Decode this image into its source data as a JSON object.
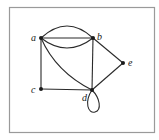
{
  "figure": {
    "type": "undirected multigraph with loop",
    "frame": {
      "x": 9,
      "y": 7,
      "width": 145,
      "height": 125,
      "stroke": "#9a9a9a"
    },
    "edge_color": "#2a2a2a",
    "node_color": "#1a1a1a"
  },
  "nodes": [
    {
      "id": "a",
      "label": "a",
      "x": 41,
      "y": 38,
      "label_x": 31,
      "label_y": 41
    },
    {
      "id": "b",
      "label": "b",
      "x": 93,
      "y": 38,
      "label_x": 97,
      "label_y": 40
    },
    {
      "id": "c",
      "label": "c",
      "x": 41,
      "y": 89,
      "label_x": 31,
      "label_y": 93
    },
    {
      "id": "d",
      "label": "d",
      "x": 92,
      "y": 90,
      "label_x": 82,
      "label_y": 101
    },
    {
      "id": "e",
      "label": "e",
      "x": 123,
      "y": 63,
      "label_x": 128,
      "label_y": 66
    }
  ],
  "edges": [
    {
      "from": "a",
      "to": "b",
      "kind": "arc-up"
    },
    {
      "from": "a",
      "to": "b",
      "kind": "straight"
    },
    {
      "from": "a",
      "to": "b",
      "kind": "arc-down"
    },
    {
      "from": "a",
      "to": "c",
      "kind": "straight"
    },
    {
      "from": "a",
      "to": "d",
      "kind": "curve"
    },
    {
      "from": "b",
      "to": "d",
      "kind": "straight"
    },
    {
      "from": "b",
      "to": "e",
      "kind": "straight"
    },
    {
      "from": "c",
      "to": "d",
      "kind": "straight"
    },
    {
      "from": "d",
      "to": "e",
      "kind": "straight"
    },
    {
      "from": "d",
      "to": "d",
      "kind": "loop"
    }
  ]
}
